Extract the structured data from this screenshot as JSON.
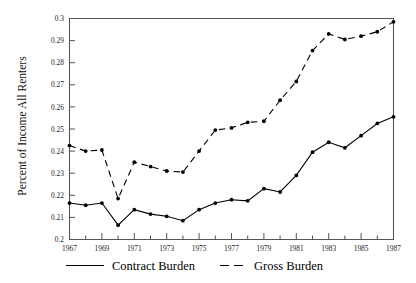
{
  "chart_data": {
    "type": "line",
    "title": "",
    "xlabel": "",
    "ylabel": "Percent of Income All Renters",
    "xlim": [
      1967,
      1987
    ],
    "ylim": [
      0.2,
      0.3
    ],
    "grid": false,
    "legend_position": "bottom",
    "ytick_labels": [
      "0.3",
      "0.29",
      "0.28",
      "0.27",
      "0.26",
      "0.25",
      "0.24",
      "0.23",
      "0.22",
      "0.21",
      "0.2"
    ],
    "ytick_values": [
      0.3,
      0.29,
      0.28,
      0.27,
      0.26,
      0.25,
      0.24,
      0.23,
      0.22,
      0.21,
      0.2
    ],
    "xtick_labels": [
      "1967",
      "1969",
      "1971",
      "1973",
      "1975",
      "1977",
      "1979",
      "1981",
      "1983",
      "1985",
      "1987"
    ],
    "xtick_values": [
      1967,
      1969,
      1971,
      1973,
      1975,
      1977,
      1979,
      1981,
      1983,
      1985,
      1987
    ],
    "x": [
      1967,
      1968,
      1969,
      1970,
      1971,
      1972,
      1973,
      1974,
      1975,
      1976,
      1977,
      1978,
      1979,
      1980,
      1981,
      1982,
      1983,
      1984,
      1985,
      1986,
      1987
    ],
    "series": [
      {
        "name": "Contract Burden",
        "style": "solid",
        "color": "#000000",
        "values": [
          0.2165,
          0.2155,
          0.2165,
          0.2065,
          0.2135,
          0.2115,
          0.2105,
          0.2085,
          0.2135,
          0.2165,
          0.218,
          0.2175,
          0.223,
          0.2215,
          0.229,
          0.2395,
          0.244,
          0.2415,
          0.247,
          0.2525,
          0.2555
        ]
      },
      {
        "name": "Gross Burden",
        "style": "dashed",
        "color": "#000000",
        "values": [
          0.2425,
          0.24,
          0.2405,
          0.2185,
          0.235,
          0.233,
          0.231,
          0.2305,
          0.24,
          0.2495,
          0.2505,
          0.253,
          0.2535,
          0.263,
          0.2715,
          0.2855,
          0.293,
          0.2905,
          0.292,
          0.294,
          0.2985
        ]
      }
    ]
  },
  "legend": {
    "items": [
      {
        "label": "Contract Burden",
        "style": "solid"
      },
      {
        "label": "Gross Burden",
        "style": "dashed"
      }
    ]
  }
}
